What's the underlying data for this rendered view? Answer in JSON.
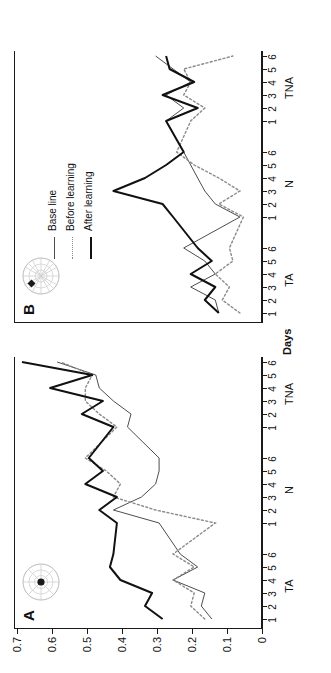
{
  "figure": {
    "axis_titles": {
      "y": "Thigmotaxis",
      "x": "Days"
    },
    "y_ticks": [
      "0",
      "0.1",
      "0.2",
      "0.3",
      "0.4",
      "0.5",
      "0.6",
      "0.7"
    ],
    "y_range": [
      0,
      0.7
    ],
    "x_groups": [
      "TA",
      "N",
      "TNA"
    ],
    "x_day_ticks": [
      "1",
      "2",
      "3",
      "4",
      "5",
      "6"
    ],
    "legend": {
      "position": "top-right of panel B",
      "entries": [
        {
          "label": "Base line",
          "style": "solid-thin",
          "color": "#4d4d4d"
        },
        {
          "label": "Before learning",
          "style": "dotted",
          "color": "#8a8a8a"
        },
        {
          "label": "After learning",
          "style": "solid-thick",
          "color": "#111111"
        }
      ]
    },
    "panels": [
      {
        "id": "A",
        "letter": "A",
        "icon": "circular-arena-center-platform-icon"
      },
      {
        "id": "B",
        "letter": "B",
        "icon": "circular-arena-peripheral-platform-icon"
      }
    ]
  },
  "chart_data": [
    {
      "type": "line",
      "panel": "A",
      "title": "A",
      "xlabel": "Days",
      "ylabel": "Thigmotaxis",
      "ylim": [
        0,
        0.7
      ],
      "grid": false,
      "legend_position": "panel B, upper right",
      "x_groups": [
        "TA",
        "N",
        "TNA"
      ],
      "x": [
        "TA1",
        "TA2",
        "TA3",
        "TA4",
        "TA5",
        "TA6",
        "N1",
        "N2",
        "N3",
        "N4",
        "N5",
        "N6",
        "TNA1",
        "TNA2",
        "TNA3",
        "TNA4",
        "TNA5",
        "TNA6"
      ],
      "series": [
        {
          "name": "Base line",
          "style": "solid-thin",
          "color": "#4d4d4d",
          "values": [
            0.14,
            0.17,
            0.16,
            0.25,
            0.18,
            0.23,
            0.29,
            0.42,
            0.34,
            0.3,
            0.29,
            0.29,
            0.38,
            0.37,
            0.42,
            0.46,
            0.47,
            0.58
          ]
        },
        {
          "name": "Before learning",
          "style": "dotted",
          "color": "#8a8a8a",
          "values": [
            0.16,
            0.2,
            0.19,
            0.25,
            0.19,
            0.25,
            0.13,
            0.3,
            0.42,
            0.4,
            0.44,
            0.5,
            0.41,
            0.46,
            0.5,
            0.5,
            0.48,
            0.57
          ]
        },
        {
          "name": "After learning",
          "style": "solid-thick",
          "color": "#111111",
          "values": [
            0.28,
            0.33,
            0.31,
            0.4,
            0.43,
            0.42,
            0.41,
            0.46,
            0.41,
            0.5,
            0.45,
            0.49,
            0.42,
            0.51,
            0.45,
            0.6,
            0.48,
            0.68
          ]
        }
      ]
    },
    {
      "type": "line",
      "panel": "B",
      "title": "B",
      "xlabel": "Days",
      "ylabel": "Thigmotaxis",
      "ylim": [
        0,
        0.7
      ],
      "grid": false,
      "legend_position": "upper right",
      "x_groups": [
        "TA",
        "N",
        "TNA"
      ],
      "x": [
        "TA1",
        "TA2",
        "TA3",
        "TA4",
        "TA5",
        "TA6",
        "N1",
        "N2",
        "N3",
        "N4",
        "N5",
        "N6",
        "TNA1",
        "TNA2",
        "TNA3",
        "TNA4",
        "TNA5",
        "TNA6"
      ],
      "series": [
        {
          "name": "Base line",
          "style": "solid-thin",
          "color": "#4d4d4d",
          "values": [
            0.12,
            0.13,
            0.2,
            0.13,
            0.16,
            0.22,
            0.06,
            0.13,
            0.16,
            0.18,
            0.2,
            0.22,
            0.27,
            0.22,
            0.27,
            0.2,
            0.25,
            0.3
          ]
        },
        {
          "name": "Before learning",
          "style": "dotted",
          "color": "#8a8a8a",
          "values": [
            0.06,
            0.11,
            0.09,
            0.13,
            0.08,
            0.09,
            0.05,
            0.12,
            0.06,
            0.12,
            0.19,
            0.24,
            0.2,
            0.16,
            0.22,
            0.2,
            0.22,
            0.08
          ]
        },
        {
          "name": "After learning",
          "style": "solid-thick",
          "color": "#111111",
          "values": [
            0.12,
            0.16,
            0.13,
            0.2,
            0.14,
            0.18,
            0.25,
            0.28,
            0.42,
            0.33,
            0.27,
            0.22,
            0.27,
            0.18,
            0.28,
            0.19,
            0.26,
            0.27
          ]
        }
      ]
    }
  ]
}
